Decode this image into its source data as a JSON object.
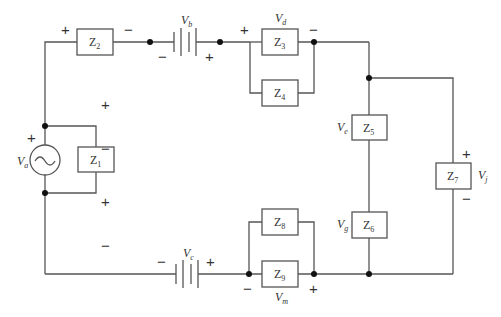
{
  "diagram": {
    "type": "circuit-schematic",
    "impedances": [
      {
        "id": "Z1",
        "label": "Z",
        "sub": "1"
      },
      {
        "id": "Z2",
        "label": "Z",
        "sub": "2"
      },
      {
        "id": "Z3",
        "label": "Z",
        "sub": "3"
      },
      {
        "id": "Z4",
        "label": "Z",
        "sub": "4"
      },
      {
        "id": "Z5",
        "label": "Z",
        "sub": "5"
      },
      {
        "id": "Z6",
        "label": "Z",
        "sub": "6"
      },
      {
        "id": "Z7",
        "label": "Z",
        "sub": "7"
      },
      {
        "id": "Z8",
        "label": "Z",
        "sub": "8"
      },
      {
        "id": "Z9",
        "label": "Z",
        "sub": "9"
      }
    ],
    "sources": {
      "va": {
        "label": "V",
        "sub": "a",
        "kind": "ac-source"
      },
      "vb": {
        "label": "V",
        "sub": "b",
        "kind": "dc-battery"
      },
      "vc": {
        "label": "V",
        "sub": "c",
        "kind": "dc-battery"
      }
    },
    "voltages": {
      "vd": {
        "label": "V",
        "sub": "d"
      },
      "ve": {
        "label": "V",
        "sub": "e"
      },
      "vg": {
        "label": "V",
        "sub": "g"
      },
      "vj": {
        "label": "V",
        "sub": "j"
      },
      "vm": {
        "label": "V",
        "sub": "m"
      }
    },
    "signs": {
      "plus": "+",
      "minus": "−"
    }
  }
}
